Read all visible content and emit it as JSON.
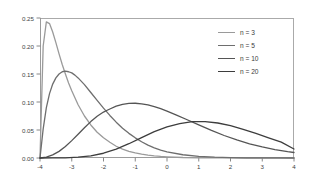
{
  "chart_data": {
    "type": "line",
    "title": "",
    "xlabel": "",
    "ylabel": "",
    "xlim": [
      -4,
      4
    ],
    "ylim": [
      0,
      0.25
    ],
    "grid": false,
    "legend_position": "top-right",
    "xticks": [
      "-4",
      "-3",
      "-2",
      "-1",
      "0",
      "1",
      "2",
      "3",
      "4"
    ],
    "xtick_values": [
      -4,
      -3,
      -2,
      -1,
      0,
      1,
      2,
      3,
      4
    ],
    "yticks": [
      "0.00",
      "0.05",
      "0.10",
      "0.15",
      "0.20",
      "0.25"
    ],
    "ytick_values": [
      0.0,
      0.05,
      0.1,
      0.15,
      0.2,
      0.25
    ],
    "series": [
      {
        "name": "n = 3",
        "color": "#9a9a9a",
        "peak_x": -3.78,
        "peak_y": 0.243,
        "x": [
          -4.0,
          -3.9,
          -3.8,
          -3.7,
          -3.6,
          -3.5,
          -3.4,
          -3.3,
          -3.2,
          -3.1,
          -3.0,
          -2.8,
          -2.6,
          -2.4,
          -2.2,
          -2.0,
          -1.8,
          -1.6,
          -1.4,
          -1.2,
          -1.0,
          -0.8,
          -0.6,
          -0.4,
          -0.2,
          0.0,
          0.5,
          1.0,
          1.5,
          2.0,
          2.5,
          3.0,
          3.5,
          4.0
        ],
        "y": [
          0.0,
          0.2,
          0.243,
          0.24,
          0.225,
          0.206,
          0.186,
          0.167,
          0.15,
          0.134,
          0.12,
          0.095,
          0.075,
          0.059,
          0.046,
          0.036,
          0.028,
          0.021,
          0.016,
          0.012,
          0.0092,
          0.0069,
          0.0052,
          0.0038,
          0.0028,
          0.0021,
          0.0009,
          0.0004,
          0.00015,
          6e-05,
          2e-05,
          1e-05,
          0.0,
          0.0
        ]
      },
      {
        "name": "n = 5",
        "color": "#6e6e6e",
        "peak_x": -3.2,
        "peak_y": 0.155,
        "x": [
          -4.0,
          -3.9,
          -3.8,
          -3.7,
          -3.6,
          -3.5,
          -3.4,
          -3.3,
          -3.2,
          -3.1,
          -3.0,
          -2.9,
          -2.8,
          -2.6,
          -2.4,
          -2.2,
          -2.0,
          -1.8,
          -1.6,
          -1.4,
          -1.2,
          -1.0,
          -0.8,
          -0.6,
          -0.4,
          -0.2,
          0.0,
          0.5,
          1.0,
          1.5,
          2.0,
          2.5,
          3.0,
          3.5,
          4.0
        ],
        "y": [
          0.0,
          0.052,
          0.09,
          0.115,
          0.132,
          0.143,
          0.15,
          0.154,
          0.155,
          0.154,
          0.152,
          0.148,
          0.143,
          0.131,
          0.117,
          0.103,
          0.089,
          0.076,
          0.064,
          0.053,
          0.044,
          0.036,
          0.029,
          0.023,
          0.018,
          0.014,
          0.011,
          0.0058,
          0.0029,
          0.0014,
          0.0007,
          0.0003,
          0.00015,
          7e-05,
          3e-05
        ]
      },
      {
        "name": "n = 10",
        "color": "#555555",
        "peak_x": -1.9,
        "peak_y": 0.098,
        "x": [
          -4.0,
          -3.8,
          -3.6,
          -3.4,
          -3.2,
          -3.0,
          -2.8,
          -2.6,
          -2.4,
          -2.2,
          -2.0,
          -1.9,
          -1.8,
          -1.6,
          -1.4,
          -1.2,
          -1.0,
          -0.8,
          -0.6,
          -0.4,
          -0.2,
          0.0,
          0.3,
          0.6,
          1.0,
          1.4,
          1.8,
          2.2,
          2.6,
          3.0,
          3.4,
          3.8,
          4.0
        ],
        "y": [
          0.0,
          0.0016,
          0.0055,
          0.0118,
          0.0205,
          0.031,
          0.0424,
          0.054,
          0.065,
          0.0745,
          0.082,
          0.0848,
          0.0875,
          0.0925,
          0.0958,
          0.0975,
          0.0978,
          0.0968,
          0.0947,
          0.0917,
          0.088,
          0.0837,
          0.0767,
          0.0692,
          0.059,
          0.0492,
          0.0402,
          0.0322,
          0.0254,
          0.0197,
          0.0151,
          0.0114,
          0.0098
        ]
      },
      {
        "name": "n = 20",
        "color": "#3d3d3d",
        "peak_x": 0.8,
        "peak_y": 0.065,
        "x": [
          -4.0,
          -3.6,
          -3.2,
          -2.8,
          -2.4,
          -2.0,
          -1.6,
          -1.2,
          -0.8,
          -0.4,
          0.0,
          0.4,
          0.8,
          1.2,
          1.6,
          2.0,
          2.4,
          2.8,
          3.2,
          3.6,
          4.0
        ],
        "y": [
          0.0,
          5e-05,
          0.00035,
          0.0014,
          0.0039,
          0.0085,
          0.0158,
          0.0255,
          0.0365,
          0.047,
          0.0555,
          0.0615,
          0.0648,
          0.065,
          0.0625,
          0.0578,
          0.0512,
          0.0438,
          0.036,
          0.0283,
          0.016
        ]
      }
    ]
  },
  "axes": {
    "frame_color": "#aaaaaa",
    "tick_color": "#888888",
    "label_color": "#3f3f3f"
  },
  "legend": {
    "entries": [
      {
        "label": "n = 3"
      },
      {
        "label": "n = 5"
      },
      {
        "label": "n = 10"
      },
      {
        "label": "n = 20"
      }
    ]
  }
}
